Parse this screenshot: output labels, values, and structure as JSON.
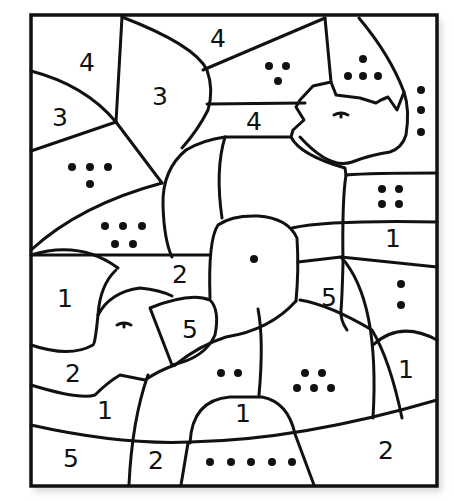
{
  "worksheet": {
    "title": "Color by number - rhino and elephant",
    "line_color": "#111111",
    "background": "#ffffff",
    "animals": [
      "rhino",
      "elephant"
    ],
    "number_labels": [
      {
        "id": "r1",
        "text": "4",
        "x": 87,
        "y": 62
      },
      {
        "id": "r2",
        "text": "4",
        "x": 218,
        "y": 38
      },
      {
        "id": "r3",
        "text": "3",
        "x": 160,
        "y": 96
      },
      {
        "id": "r4",
        "text": "3",
        "x": 60,
        "y": 117
      },
      {
        "id": "r5",
        "text": "4",
        "x": 254,
        "y": 121
      },
      {
        "id": "r6",
        "text": "1",
        "x": 393,
        "y": 238
      },
      {
        "id": "r7",
        "text": "2",
        "x": 180,
        "y": 274
      },
      {
        "id": "r8",
        "text": "1",
        "x": 65,
        "y": 298
      },
      {
        "id": "r9",
        "text": "5",
        "x": 329,
        "y": 297
      },
      {
        "id": "r10",
        "text": "5",
        "x": 190,
        "y": 329
      },
      {
        "id": "r11",
        "text": "2",
        "x": 73,
        "y": 373
      },
      {
        "id": "r12",
        "text": "1",
        "x": 406,
        "y": 369
      },
      {
        "id": "r13",
        "text": "1",
        "x": 105,
        "y": 410
      },
      {
        "id": "r14",
        "text": "1",
        "x": 243,
        "y": 413
      },
      {
        "id": "r15",
        "text": "5",
        "x": 71,
        "y": 458
      },
      {
        "id": "r16",
        "text": "2",
        "x": 156,
        "y": 460
      },
      {
        "id": "r17",
        "text": "2",
        "x": 386,
        "y": 450
      }
    ],
    "dot_labels": [
      {
        "id": "d1",
        "count": 4,
        "x": 90,
        "y": 172,
        "layout": "3-1"
      },
      {
        "id": "d2",
        "count": 5,
        "x": 123,
        "y": 235,
        "layout": "3-2"
      },
      {
        "id": "d3",
        "count": 3,
        "x": 278,
        "y": 72,
        "layout": "2-1"
      },
      {
        "id": "d4",
        "count": 4,
        "x": 365,
        "y": 69,
        "layout": "1-3"
      },
      {
        "id": "d5",
        "count": 3,
        "x": 421,
        "y": 110,
        "layout": "vertical"
      },
      {
        "id": "d6",
        "count": 4,
        "x": 391,
        "y": 195,
        "layout": "2-2"
      },
      {
        "id": "d7",
        "count": 1,
        "x": 254,
        "y": 259,
        "layout": "single"
      },
      {
        "id": "d8",
        "count": 2,
        "x": 401,
        "y": 294,
        "layout": "vertical"
      },
      {
        "id": "d9",
        "count": 2,
        "x": 230,
        "y": 373,
        "layout": "pair"
      },
      {
        "id": "d10",
        "count": 5,
        "x": 314,
        "y": 380,
        "layout": "2-3"
      },
      {
        "id": "d11",
        "count": 5,
        "x": 245,
        "y": 460,
        "layout": "row"
      }
    ]
  }
}
